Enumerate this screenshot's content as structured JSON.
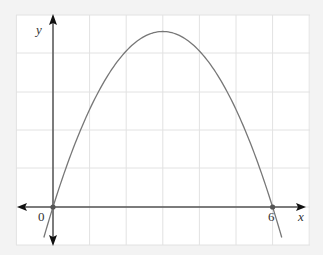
{
  "chart_data": {
    "type": "line",
    "title": "",
    "xlabel": "x",
    "ylabel": "y",
    "x_tick_labels": [
      "0",
      "6"
    ],
    "grid": true,
    "function": "parabola opening downward with roots at x = 0 and x = 6, vertex at x = 3",
    "roots": [
      0,
      6
    ],
    "vertex_x": 3,
    "marked_points": [
      {
        "x": 0,
        "y": 0
      },
      {
        "x": 6,
        "y": 0
      }
    ],
    "x_range_grid": [
      -1,
      7
    ],
    "series": [
      {
        "name": "curve",
        "x": [
          -0.25,
          0,
          0.5,
          1,
          1.5,
          2,
          2.5,
          3,
          3.5,
          4,
          4.5,
          5,
          5.5,
          6,
          6.25
        ],
        "relative_height": [
          -0.174,
          0,
          0.306,
          0.556,
          0.75,
          0.889,
          0.972,
          1.0,
          0.972,
          0.889,
          0.75,
          0.556,
          0.306,
          0,
          -0.174
        ]
      }
    ]
  },
  "axes": {
    "x_label": "x",
    "y_label": "y",
    "origin_label": "0",
    "x_mark_label": "6"
  },
  "colors": {
    "background": "#f3f3f3",
    "plot_area": "#ffffff",
    "grid": "#e2e2e2",
    "axis": "#555555",
    "curve": "#777777",
    "point": "#555555"
  }
}
